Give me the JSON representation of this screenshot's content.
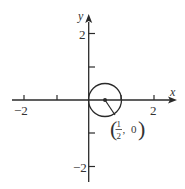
{
  "diagram": {
    "type": "coordinate-plane-with-circle",
    "colors": {
      "ink": "#2a2a2a",
      "background": "#ffffff"
    },
    "axes": {
      "x_label": "x",
      "y_label": "y",
      "x_tick_labels": [
        {
          "value": -2,
          "text": "−2"
        },
        {
          "value": 2,
          "text": "2"
        }
      ],
      "y_tick_labels": [
        {
          "value": 2,
          "text": "2"
        },
        {
          "value": -2,
          "text": "−2"
        }
      ],
      "x_ticks": [
        -2,
        -1,
        1,
        2
      ],
      "y_ticks": [
        -2,
        -1,
        1,
        2
      ],
      "range": [
        -2.4,
        2.4
      ]
    },
    "circle": {
      "center": [
        0.5,
        0
      ],
      "radius": 0.5,
      "center_label": {
        "open": "(",
        "numerator": "1",
        "denominator": "2",
        "sep": ", ",
        "y": "0",
        "close": ")"
      }
    }
  }
}
